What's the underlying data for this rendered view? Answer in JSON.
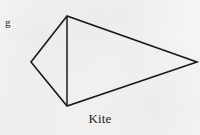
{
  "figure": {
    "caption": "Kite",
    "corner_label": "g",
    "shape_name": "kite",
    "stroke_color": "#1a1a1a",
    "fill_color": "none",
    "background_color": "#f4f3f1",
    "stroke_width": 1.6,
    "vertices": {
      "top": {
        "x": 67,
        "y": 16
      },
      "left": {
        "x": 31,
        "y": 62
      },
      "right": {
        "x": 197,
        "y": 62
      },
      "bottom": {
        "x": 67,
        "y": 106
      }
    },
    "outline_path": "M 67 16 L 31 62 L 67 106 L 197 62 Z",
    "diagonal_path": "M 67 16 L 67 106",
    "edges": [
      {
        "name": "top-left-edge",
        "from": "top",
        "to": "left"
      },
      {
        "name": "left-bottom-edge",
        "from": "left",
        "to": "bottom"
      },
      {
        "name": "bottom-right-edge",
        "from": "bottom",
        "to": "right"
      },
      {
        "name": "right-top-edge",
        "from": "right",
        "to": "top"
      }
    ],
    "diagonal": {
      "name": "short-diagonal",
      "from": "top",
      "to": "bottom"
    }
  }
}
